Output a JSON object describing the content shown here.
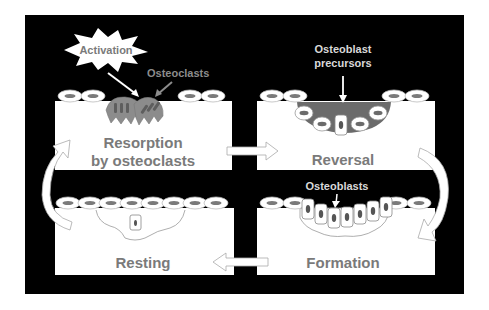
{
  "diagram": {
    "colors": {
      "background": "#000000",
      "panel": "#ffffff",
      "stage_text": "#7a7a7a",
      "cell_label": "#d9d9d9",
      "osteoclast": "#8c8c8c",
      "osteoclast_dark": "#5e5e5e",
      "lining_cell_nucleus": "#7a7a7a",
      "reversal_zone": "#6b6b6b"
    },
    "stages": [
      {
        "id": "resorption",
        "label_line1": "Resorption",
        "label_line2": "by osteoclasts"
      },
      {
        "id": "reversal",
        "label_line1": "Reversal"
      },
      {
        "id": "formation",
        "label_line1": "Formation"
      },
      {
        "id": "resting",
        "label_line1": "Resting"
      }
    ],
    "annotations": {
      "activation": "Activation",
      "osteoclasts": "Osteoclasts",
      "osteoblast_precursors_line1": "Osteoblast",
      "osteoblast_precursors_line2": "precursors",
      "osteoblasts": "Osteoblasts"
    },
    "flow": [
      "Resorption by osteoclasts",
      "Reversal",
      "Formation",
      "Resting",
      "Resorption by osteoclasts"
    ]
  }
}
